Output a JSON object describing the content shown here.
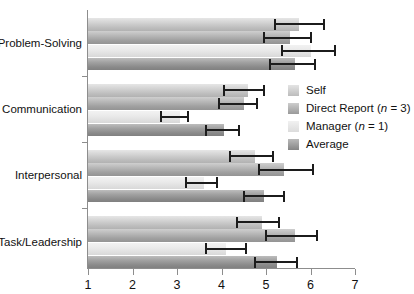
{
  "chart_data": {
    "type": "bar",
    "orientation": "horizontal",
    "title": "",
    "xlabel": "",
    "ylabel": "",
    "xlim": [
      1,
      7
    ],
    "xticks": [
      1,
      2,
      3,
      4,
      5,
      6,
      7
    ],
    "xticklabels": [
      "1",
      "2",
      "3",
      "4",
      "5",
      "6",
      "7"
    ],
    "grid": false,
    "legend_position": "center-right",
    "categories": [
      "Problem-Solving",
      "Communication",
      "Interpersonal",
      "Task/Leadership"
    ],
    "series": [
      {
        "name": "Self",
        "values": [
          5.75,
          4.6,
          4.75,
          4.9
        ],
        "err_low": [
          5.2,
          4.05,
          4.2,
          4.35
        ],
        "err_high": [
          6.3,
          4.95,
          5.15,
          5.3
        ]
      },
      {
        "name": "Direct Report (n = 3)",
        "values": [
          5.55,
          4.5,
          5.4,
          5.65
        ],
        "err_low": [
          4.95,
          3.95,
          4.85,
          5.0
        ],
        "err_high": [
          6.0,
          4.8,
          6.05,
          6.15
        ]
      },
      {
        "name": "Manager (n = 1)",
        "values": [
          6.0,
          3.07,
          3.6,
          4.1
        ],
        "err_low": [
          5.35,
          2.65,
          3.2,
          3.65
        ],
        "err_high": [
          6.55,
          3.25,
          3.9,
          4.55
        ]
      },
      {
        "name": "Average",
        "values": [
          5.65,
          4.05,
          4.95,
          5.25
        ],
        "err_low": [
          5.1,
          3.65,
          4.5,
          4.75
        ],
        "err_high": [
          6.1,
          4.4,
          5.4,
          5.7
        ]
      }
    ],
    "legend": [
      {
        "label": "Self",
        "note": "",
        "color": "#d3d3d3"
      },
      {
        "label": "Direct Report (",
        "note": "n",
        "note_tail": " = 3)",
        "color": "#b0b0b0"
      },
      {
        "label": "Manager (",
        "note": "n",
        "note_tail": " = 1)",
        "color": "#e8e8e8"
      },
      {
        "label": "Average",
        "note": "",
        "color": "#999999"
      }
    ]
  },
  "axis": {
    "tick_1": "1",
    "tick_2": "2",
    "tick_3": "3",
    "tick_4": "4",
    "tick_5": "5",
    "tick_6": "6",
    "tick_7": "7"
  },
  "categories": {
    "c0": "Problem-Solving",
    "c1": "Communication",
    "c2": "Interpersonal",
    "c3": "Task/Leadership"
  },
  "legend": {
    "self": "Self",
    "direct_pre": "Direct Report (",
    "direct_italic": "n",
    "direct_post": " = 3)",
    "manager_pre": "Manager (",
    "manager_italic": "n",
    "manager_post": " = 1)",
    "average": "Average"
  }
}
